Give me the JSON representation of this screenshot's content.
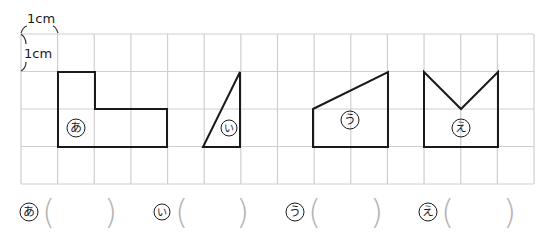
{
  "units": {
    "horizontal": "1cm",
    "vertical": "1cm"
  },
  "grid": {
    "columns": 14,
    "rows": 4,
    "x0": 21,
    "y0": 34,
    "x1": 534,
    "y1": 184,
    "line_color": "#cfcfcf"
  },
  "shapes": [
    {
      "id": "a",
      "label": "あ",
      "type": "L-shape",
      "points": "58,72 95,72 95,109 167,109 167,147 58,147",
      "label_pos": [
        76,
        128
      ]
    },
    {
      "id": "i",
      "label": "い",
      "type": "right-triangle",
      "points": "203,147 240,147 240,72",
      "label_pos": [
        229,
        128
      ]
    },
    {
      "id": "u",
      "label": "う",
      "type": "trapezoid",
      "points": "313,109 388,72 388,147 313,147",
      "label_pos": [
        350,
        120
      ]
    },
    {
      "id": "e",
      "label": "え",
      "type": "notched-pentagon",
      "points": "424,72 461,109 498,72 498,147 424,147",
      "label_pos": [
        461,
        128
      ]
    }
  ],
  "answers": [
    {
      "label": "あ",
      "open": "(",
      "close": ")",
      "value": ""
    },
    {
      "label": "い",
      "open": "(",
      "close": ")",
      "value": ""
    },
    {
      "label": "う",
      "open": "(",
      "close": ")",
      "value": ""
    },
    {
      "label": "え",
      "open": "(",
      "close": ")",
      "value": ""
    }
  ]
}
